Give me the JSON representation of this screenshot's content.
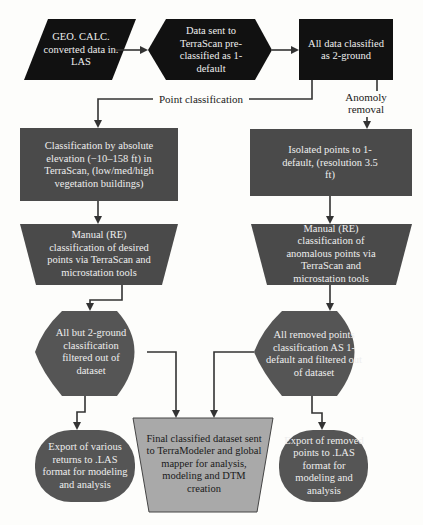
{
  "colors": {
    "black_node": "#111111",
    "dark_gray_node": "#4a4a4a",
    "light_gray_node": "#a9a9a9",
    "arrow": "#222222",
    "background": "#fdfdfb"
  },
  "nodes": {
    "input": {
      "shape": "parallelogram",
      "text": "GEO. CALC. converted data in. LAS"
    },
    "terrascan": {
      "shape": "hexagon",
      "text": "Data sent to TerraScan pre-classified as 1-default"
    },
    "ground": {
      "shape": "rectangle",
      "text": "All data classified as 2-ground"
    },
    "elevation": {
      "shape": "rectangle",
      "text": "Classification by absolute elevation (−10–158 ft) in TerraScan, (low/med/high vegetation buildings)"
    },
    "isolated": {
      "shape": "rectangle",
      "text": "Isolated points to 1-default, (resolution 3.5 ft)"
    },
    "manual_left": {
      "shape": "trapezoid",
      "text": "Manual (RE) classification of desired points via TerraScan and microstation tools"
    },
    "manual_right": {
      "shape": "trapezoid",
      "text": "Manual (RE) classification of anomalous points via TerraScan and microstation tools"
    },
    "filter_left": {
      "shape": "display",
      "text": "All but 2-ground classification filtered out of dataset"
    },
    "filter_right": {
      "shape": "display",
      "text": "All removed points classification AS 1-default and filtered out of dataset"
    },
    "export_left": {
      "shape": "rounded",
      "text": "Export of various returns to .LAS format for modeling and analysis"
    },
    "final": {
      "shape": "trapezoid",
      "text": "Final classified dataset sent to TerraModeler and global mapper for analysis, modeling and DTM creation"
    },
    "export_right": {
      "shape": "rounded",
      "text": "Export of removed points to .LAS format for modeling and analysis"
    }
  },
  "labels": {
    "point_classification": "Point classification",
    "anomaly_removal": "Anomoly removal"
  },
  "edges": [
    {
      "from": "input",
      "to": "terrascan"
    },
    {
      "from": "terrascan",
      "to": "ground"
    },
    {
      "from": "ground",
      "to": "elevation",
      "label": "Point classification"
    },
    {
      "from": "ground",
      "to": "isolated",
      "label": "Anomoly removal"
    },
    {
      "from": "elevation",
      "to": "manual_left"
    },
    {
      "from": "isolated",
      "to": "manual_right"
    },
    {
      "from": "manual_left",
      "to": "filter_left"
    },
    {
      "from": "manual_right",
      "to": "filter_right"
    },
    {
      "from": "filter_left",
      "to": "export_left"
    },
    {
      "from": "filter_left",
      "to": "final"
    },
    {
      "from": "filter_right",
      "to": "final"
    },
    {
      "from": "filter_right",
      "to": "export_right"
    }
  ]
}
